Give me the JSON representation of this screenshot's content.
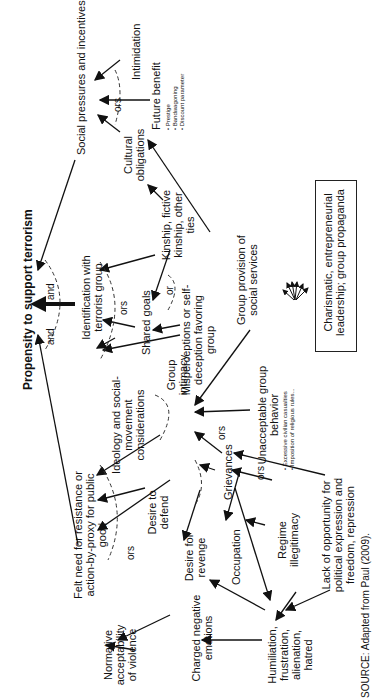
{
  "title": "Propensity to support terrorism",
  "nodes": {
    "social_pressures": "Social pressures and incentives",
    "intimidation": "Intimidation",
    "future_benefit": "Future benefit",
    "future_benefit_bullets": [
      "Prestige",
      "Bandwagoning",
      "Discount parameter"
    ],
    "cultural_obligations": "Cultural obligations",
    "kinship": "Kinship, fictive kinship, other ties",
    "identification": "Identification with terrorist group",
    "shared_goals": "Shared goals",
    "misperceptions": "Misperceptions or self-deception favoring group",
    "group_social_services": "Group provision of social services",
    "leadership": "Charismatic, entrepreneurial leadership; group propaganda",
    "ideology": "Ideology and social-movement considerations",
    "group_intimacy": "Group intimacy",
    "unacceptable": "Unacceptable group behavior",
    "unacceptable_bullets": [
      "Excessive civilian casualties",
      "Imposition of religious rules..."
    ],
    "grievances": "Grievances",
    "felt_need": "Felt need for resistance or action-by-proxy for public good",
    "desire_defend": "Desire to defend",
    "desire_revenge": "Desire for revenge",
    "occupation": "Occupation",
    "regime": "Regime illegitimacy",
    "lack_opportunity": "Lack of opportunity for political expression and freedom, repression",
    "normative": "Normative acceptability of violence",
    "charged": "Charged negative emotions",
    "humiliation": "Humiliation, frustration, alienation, hatred"
  },
  "connectors": {
    "and1": "and",
    "and2": "and",
    "ors": "ors",
    "or": "or"
  },
  "source": "SOURCE: Adapted from Paul (2009)."
}
